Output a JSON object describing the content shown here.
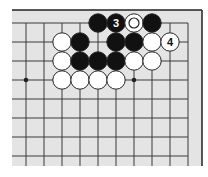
{
  "diagram": {
    "type": "go-board-partial",
    "colors": {
      "page_background": "#ffffff",
      "board_background": "#e4e4e4",
      "grid_line": "#3a3a3a",
      "edge_line": "#222222",
      "black_stone": "#111111",
      "white_stone": "#ffffff",
      "stone_outline": "#222222"
    },
    "grid": {
      "columns_x": [
        26,
        44,
        62,
        80,
        98,
        116,
        134,
        152,
        170,
        188
      ],
      "rows_y": [
        23,
        42,
        61,
        80,
        99,
        118,
        137,
        156
      ],
      "board_rect": {
        "x": 12,
        "y": 10,
        "right": 202,
        "bottom": 166
      },
      "top_edge": true,
      "right_edge": true
    },
    "star_points": [
      {
        "col": 0,
        "row": 3
      },
      {
        "col": 6,
        "row": 3
      }
    ],
    "stones": [
      {
        "col": 4,
        "row": 0,
        "color": "black"
      },
      {
        "col": 5,
        "row": 0,
        "color": "black",
        "label": "3"
      },
      {
        "col": 6,
        "row": 0,
        "color": "white",
        "marker": "circle"
      },
      {
        "col": 7,
        "row": 0,
        "color": "black"
      },
      {
        "col": 2,
        "row": 1,
        "color": "white"
      },
      {
        "col": 3,
        "row": 1,
        "color": "black"
      },
      {
        "col": 5,
        "row": 1,
        "color": "black"
      },
      {
        "col": 6,
        "row": 1,
        "color": "black"
      },
      {
        "col": 7,
        "row": 1,
        "color": "white"
      },
      {
        "col": 8,
        "row": 1,
        "color": "white",
        "label": "4"
      },
      {
        "col": 2,
        "row": 2,
        "color": "white"
      },
      {
        "col": 3,
        "row": 2,
        "color": "black"
      },
      {
        "col": 4,
        "row": 2,
        "color": "black"
      },
      {
        "col": 5,
        "row": 2,
        "color": "black"
      },
      {
        "col": 6,
        "row": 2,
        "color": "white"
      },
      {
        "col": 7,
        "row": 2,
        "color": "white"
      },
      {
        "col": 2,
        "row": 3,
        "color": "white"
      },
      {
        "col": 3,
        "row": 3,
        "color": "white"
      },
      {
        "col": 4,
        "row": 3,
        "color": "white"
      },
      {
        "col": 5,
        "row": 3,
        "color": "white"
      }
    ]
  }
}
